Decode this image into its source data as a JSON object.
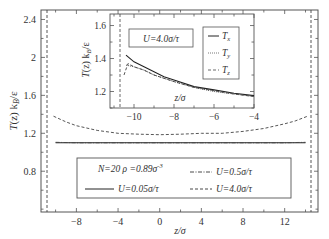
{
  "chart_data": [
    {
      "id": "main",
      "type": "line",
      "title": "",
      "xlabel": "z/σ",
      "ylabel": "T(z) k_B/ε",
      "xlim": [
        -11.4,
        15.2
      ],
      "ylim": [
        0.37,
        2.5
      ],
      "xticks": [
        -8,
        -4,
        0,
        4,
        8,
        12
      ],
      "yticks": [
        0.8,
        1.2,
        1.6,
        2.0,
        2.4
      ],
      "xtick_labels": [
        "−8",
        "−4",
        "0",
        "4",
        "8",
        "12"
      ],
      "ytick_labels": [
        "0.8",
        "1.2",
        "1.6",
        "2",
        "2.4"
      ],
      "grid": false,
      "walls": [
        -10.6,
        14.6
      ],
      "legend": {
        "position": "lower center",
        "header": "N=20 ρ =0.89σ⁻³",
        "entries": [
          "U=0.05σ/τ",
          "U=0.5σ/τ",
          "U=4.0σ/τ"
        ]
      },
      "series": [
        {
          "name": "U=0.05σ/τ",
          "style": "solid",
          "x": [
            -10,
            -8,
            -4,
            0,
            4,
            8,
            12,
            14
          ],
          "y": [
            1.1,
            1.1,
            1.1,
            1.1,
            1.1,
            1.1,
            1.1,
            1.1
          ]
        },
        {
          "name": "U=0.5σ/τ",
          "style": "dash-dot",
          "x": [
            -10,
            -8,
            -4,
            0,
            4,
            8,
            12,
            14
          ],
          "y": [
            1.105,
            1.1,
            1.1,
            1.1,
            1.1,
            1.1,
            1.1,
            1.105
          ]
        },
        {
          "name": "U=4.0σ/τ",
          "style": "dashed",
          "x": [
            -10.2,
            -9,
            -8,
            -6,
            -4,
            -2,
            0,
            2,
            4,
            6,
            8,
            10,
            12,
            13,
            14.2
          ],
          "y": [
            1.38,
            1.32,
            1.28,
            1.23,
            1.2,
            1.19,
            1.185,
            1.19,
            1.2,
            1.2,
            1.22,
            1.25,
            1.3,
            1.33,
            1.38
          ]
        }
      ]
    },
    {
      "id": "inset",
      "type": "line",
      "title": "",
      "annotation": "U=4.0σ/τ",
      "xlabel": "z/σ",
      "ylabel": "T(z) k_B/ε",
      "xlim": [
        -11.2,
        -4
      ],
      "ylim": [
        1.1,
        1.67
      ],
      "xticks": [
        -10,
        -8,
        -6,
        -4
      ],
      "yticks": [
        1.2,
        1.4,
        1.6
      ],
      "xtick_labels": [
        "−10",
        "−8",
        "−6",
        "−4"
      ],
      "ytick_labels": [
        "1.2",
        "1.4",
        "1.6"
      ],
      "grid": false,
      "wall": -10.6,
      "legend": {
        "position": "upper right",
        "entries": [
          "Tx",
          "Ty",
          "Tz"
        ]
      },
      "series": [
        {
          "name": "Tx",
          "style": "solid",
          "x": [
            -10.4,
            -10.0,
            -9.5,
            -9,
            -8.5,
            -8,
            -7,
            -6,
            -5,
            -4
          ],
          "y": [
            1.42,
            1.38,
            1.35,
            1.32,
            1.29,
            1.27,
            1.23,
            1.21,
            1.19,
            1.175
          ]
        },
        {
          "name": "Ty",
          "style": "dotted",
          "x": [
            -10.4,
            -10.0,
            -9.5,
            -9,
            -8.5,
            -8,
            -7,
            -6,
            -5,
            -4
          ],
          "y": [
            1.36,
            1.35,
            1.33,
            1.3,
            1.28,
            1.26,
            1.225,
            1.2,
            1.185,
            1.17
          ]
        },
        {
          "name": "Tz",
          "style": "dashed",
          "x": [
            -10.5,
            -10.3,
            -10.0,
            -9.5,
            -9,
            -8.5,
            -8,
            -7,
            -6,
            -5,
            -4
          ],
          "y": [
            1.3,
            1.37,
            1.35,
            1.33,
            1.3,
            1.28,
            1.26,
            1.225,
            1.205,
            1.185,
            1.17
          ]
        }
      ]
    }
  ],
  "labels": {
    "main_ylabel_T": "T",
    "main_ylabel_rest": "(z) k",
    "main_ylabel_sub": "B",
    "main_ylabel_tail": "/ε",
    "main_xlabel": "z/σ",
    "legend_header_N": "N=20 ρ =0.89σ",
    "legend_header_exp": "-3",
    "legend_u1": "U=0.05σ/τ",
    "legend_u2": "U=0.5σ/τ",
    "legend_u3": "U=4.0σ/τ",
    "inset_annotation": "U=4.0σ/τ",
    "inset_xlabel": "z/σ",
    "inset_leg_tx": "T",
    "inset_leg_tx_sub": "x",
    "inset_leg_ty": "T",
    "inset_leg_ty_sub": "y",
    "inset_leg_tz": "T",
    "inset_leg_tz_sub": "z"
  }
}
